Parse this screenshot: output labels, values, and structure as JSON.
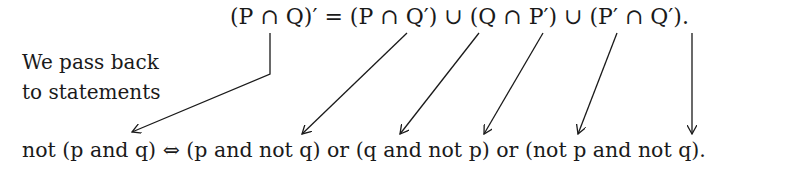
{
  "equation": {
    "set_identity": "(P ∩ Q)′ = (P ∩ Q′) ∪ (Q ∩ P′) ∪ (P′ ∩ Q′).",
    "logic_identity": "not (p and q) ⇔ (p and not q) or (q and not p) or (not p and not q)."
  },
  "annotation": {
    "line1": "We pass back",
    "line2": "to statements"
  },
  "arrows": [
    {
      "from": "P ∩ Q (intersection)",
      "to": "not (p and q)"
    },
    {
      "from": "P ∩ Q′",
      "to": "p and not q"
    },
    {
      "from": "∪",
      "to": "or"
    },
    {
      "from": "Q ∩ P′",
      "to": "q and not p"
    },
    {
      "from": "∪",
      "to": "or"
    },
    {
      "from": "P′ ∩ Q′",
      "to": "not p and not q"
    }
  ]
}
